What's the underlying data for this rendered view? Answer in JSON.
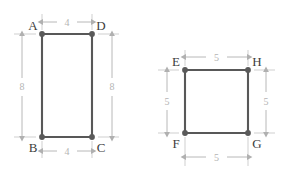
{
  "diagram": {
    "background_color": "#ffffff",
    "edge_color": "#585858",
    "vertex_color": "#5a5a5a",
    "dimension_color": "#b4b4b4",
    "label_color": "#3d3d3d",
    "figures": [
      {
        "id": "figure-left",
        "shape": "rectangle",
        "name": "ABCD",
        "vertices": [
          {
            "id": "A",
            "label": "A",
            "position": "top-left"
          },
          {
            "id": "D",
            "label": "D",
            "position": "top-right"
          },
          {
            "id": "B",
            "label": "B",
            "position": "bottom-left"
          },
          {
            "id": "C",
            "label": "C",
            "position": "bottom-right"
          }
        ],
        "dimensions": [
          {
            "id": "top",
            "label": "4",
            "orientation": "horizontal",
            "side": "AD"
          },
          {
            "id": "bottom",
            "label": "4",
            "orientation": "horizontal",
            "side": "BC"
          },
          {
            "id": "left",
            "label": "8",
            "orientation": "vertical",
            "side": "AB"
          },
          {
            "id": "right",
            "label": "8",
            "orientation": "vertical",
            "side": "DC"
          }
        ]
      },
      {
        "id": "figure-right",
        "shape": "square",
        "name": "EFGH",
        "vertices": [
          {
            "id": "E",
            "label": "E",
            "position": "top-left"
          },
          {
            "id": "H",
            "label": "H",
            "position": "top-right"
          },
          {
            "id": "F",
            "label": "F",
            "position": "bottom-left"
          },
          {
            "id": "G",
            "label": "G",
            "position": "bottom-right"
          }
        ],
        "dimensions": [
          {
            "id": "top",
            "label": "5",
            "orientation": "horizontal",
            "side": "EH"
          },
          {
            "id": "bottom",
            "label": "5",
            "orientation": "horizontal",
            "side": "FG"
          },
          {
            "id": "left",
            "label": "5",
            "orientation": "vertical",
            "side": "EF"
          },
          {
            "id": "right",
            "label": "5",
            "orientation": "vertical",
            "side": "HG"
          }
        ]
      }
    ]
  }
}
